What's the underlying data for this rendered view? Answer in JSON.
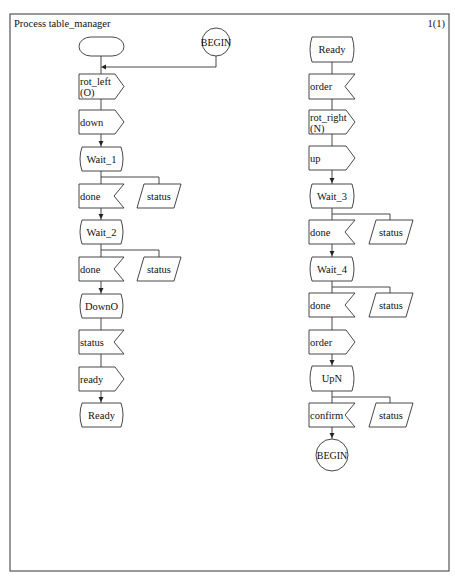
{
  "diagram": {
    "title": "Process table_manager",
    "page": "1(1)",
    "left_column": [
      {
        "type": "start",
        "label": ""
      },
      {
        "type": "output",
        "label": "rot_left",
        "label2": "(O)"
      },
      {
        "type": "output",
        "label": "down"
      },
      {
        "type": "state",
        "label": "Wait_1"
      },
      {
        "type": "input",
        "label": "done",
        "save": "status"
      },
      {
        "type": "state",
        "label": "Wait_2"
      },
      {
        "type": "input",
        "label": "done",
        "save": "status"
      },
      {
        "type": "state",
        "label": "DownO"
      },
      {
        "type": "input",
        "label": "status"
      },
      {
        "type": "output",
        "label": "ready"
      },
      {
        "type": "state",
        "label": "Ready"
      }
    ],
    "begin_connector": "BEGIN",
    "right_column": [
      {
        "type": "state",
        "label": "Ready"
      },
      {
        "type": "input",
        "label": "order"
      },
      {
        "type": "output",
        "label": "rot_right",
        "label2": "(N)"
      },
      {
        "type": "output",
        "label": "up"
      },
      {
        "type": "state",
        "label": "Wait_3"
      },
      {
        "type": "input",
        "label": "done",
        "save": "status"
      },
      {
        "type": "state",
        "label": "Wait_4"
      },
      {
        "type": "input",
        "label": "done",
        "save": "status"
      },
      {
        "type": "output",
        "label": "order"
      },
      {
        "type": "state",
        "label": "UpN"
      },
      {
        "type": "input",
        "label": "confirm",
        "save": "status"
      },
      {
        "type": "connector",
        "label": "BEGIN"
      }
    ]
  }
}
